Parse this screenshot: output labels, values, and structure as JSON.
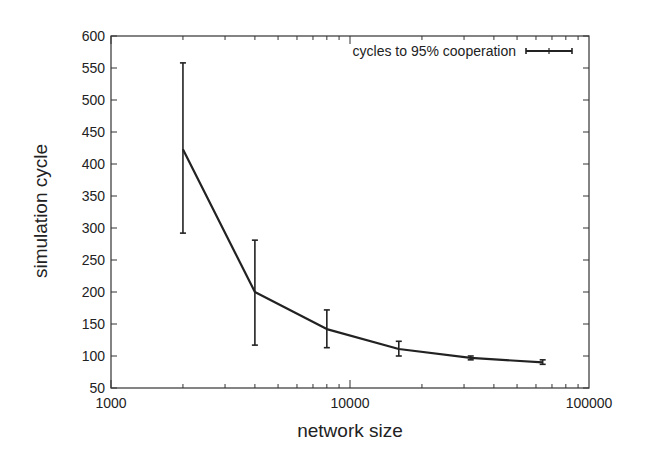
{
  "chart_data": {
    "type": "line",
    "title": "",
    "xlabel": "network size",
    "ylabel": "simulation cycle",
    "xscale": "log",
    "xlim": [
      1000,
      100000
    ],
    "ylim": [
      50,
      600
    ],
    "x_ticks": [
      "1000",
      "10000",
      "100000"
    ],
    "y_ticks": [
      "50",
      "100",
      "150",
      "200",
      "250",
      "300",
      "350",
      "400",
      "450",
      "500",
      "550",
      "600"
    ],
    "grid": false,
    "legend_position": "top-right",
    "series": [
      {
        "name": "cycles to 95% cooperation",
        "x": [
          2000,
          4000,
          8000,
          16000,
          32000,
          64000
        ],
        "values": [
          423,
          200,
          142,
          111,
          97,
          90
        ],
        "error_low": [
          292,
          117,
          113,
          100,
          94,
          87
        ],
        "error_high": [
          558,
          281,
          172,
          123,
          100,
          94
        ]
      }
    ]
  },
  "colors": {
    "line": "#222222",
    "axis": "#333333",
    "background": "#ffffff"
  }
}
